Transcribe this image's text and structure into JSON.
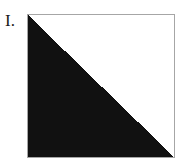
{
  "figure": {
    "label": "I.",
    "label_name": "roman-numeral-one",
    "caption": "",
    "plate": {
      "shape_name": "black-right-triangle",
      "description": "Solid black right triangle filling the lower-left half of a square frame",
      "fill_color": "#111111",
      "background_color": "#ffffff",
      "border_color": "#a6a6a6",
      "border_width_px": 1,
      "frame": {
        "x": 27,
        "y": 14,
        "width": 148,
        "height": 144
      },
      "vertices": [
        {
          "name": "top-left",
          "x": 0,
          "y": 0
        },
        {
          "name": "bottom-left",
          "x": 0,
          "y": 144
        },
        {
          "name": "bottom-right",
          "x": 148,
          "y": 144
        }
      ],
      "hypotenuse": {
        "from": "top-left",
        "to": "bottom-right",
        "direction": "descending"
      },
      "fill_fraction": "1/2"
    }
  },
  "canvas": {
    "width": 183,
    "height": 167,
    "background_color": "#ffffff"
  }
}
